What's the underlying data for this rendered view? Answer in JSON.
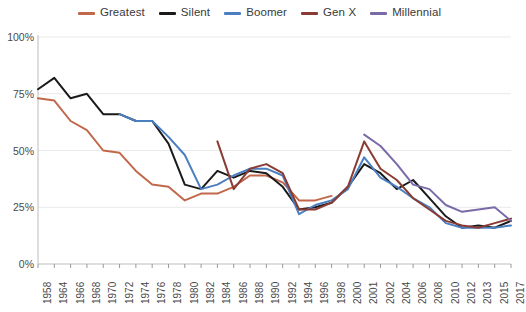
{
  "chart_data": {
    "type": "line",
    "title": "",
    "xlabel": "",
    "ylabel": "",
    "ylim": [
      0,
      100
    ],
    "ytick_labels": [
      "0%",
      "25%",
      "50%",
      "75%",
      "100%"
    ],
    "ytick_values": [
      0,
      25,
      50,
      75,
      100
    ],
    "grid": true,
    "legend_position": "top-center",
    "x": [
      1958,
      1964,
      1966,
      1968,
      1970,
      1972,
      1974,
      1976,
      1978,
      1980,
      1982,
      1984,
      1986,
      1988,
      1990,
      1992,
      1994,
      1996,
      1998,
      2000,
      2001,
      2002,
      2004,
      2006,
      2008,
      2010,
      2012,
      2013,
      2015,
      2017
    ],
    "categories": [
      "1958",
      "1964",
      "1966",
      "1968",
      "1970",
      "1972",
      "1974",
      "1976",
      "1978",
      "1980",
      "1982",
      "1984",
      "1986",
      "1988",
      "1990",
      "1992",
      "1994",
      "1996",
      "1998",
      "2000",
      "2001",
      "2002",
      "2004",
      "2006",
      "2008",
      "2010",
      "2012",
      "2013",
      "2015",
      "2017"
    ],
    "series": [
      {
        "name": "Greatest",
        "color": "#c1684a",
        "values": [
          73,
          72,
          63,
          59,
          50,
          49,
          41,
          35,
          34,
          28,
          31,
          31,
          34,
          39,
          39,
          36,
          28,
          28,
          30,
          null,
          null,
          null,
          null,
          null,
          null,
          null,
          null,
          null,
          null,
          null
        ]
      },
      {
        "name": "Silent",
        "color": "#1a1a1a",
        "values": [
          77,
          82,
          73,
          75,
          66,
          66,
          63,
          63,
          53,
          35,
          33,
          41,
          38,
          41,
          40,
          34,
          24,
          25,
          27,
          34,
          44,
          40,
          33,
          37,
          29,
          21,
          16,
          17,
          16,
          19
        ]
      },
      {
        "name": "Boomer",
        "color": "#4a7fc1",
        "values": [
          null,
          null,
          null,
          null,
          null,
          66,
          63,
          63,
          56,
          48,
          33,
          35,
          39,
          42,
          42,
          39,
          22,
          26,
          28,
          33,
          47,
          38,
          34,
          29,
          25,
          18,
          16,
          16,
          16,
          17
        ]
      },
      {
        "name": "Gen X",
        "color": "#8a3b33",
        "values": [
          null,
          null,
          null,
          null,
          null,
          null,
          null,
          null,
          null,
          null,
          null,
          54,
          33,
          42,
          44,
          40,
          24,
          24,
          27,
          34,
          54,
          42,
          37,
          29,
          24,
          19,
          17,
          16,
          18,
          20
        ]
      },
      {
        "name": "Millennial",
        "color": "#7a6ba8",
        "values": [
          null,
          null,
          null,
          null,
          null,
          null,
          null,
          null,
          null,
          null,
          null,
          null,
          null,
          null,
          null,
          null,
          null,
          null,
          null,
          null,
          57,
          52,
          44,
          35,
          33,
          26,
          23,
          24,
          25,
          19
        ]
      }
    ]
  },
  "legend": {
    "items": [
      {
        "label": "Greatest",
        "color": "#c1684a"
      },
      {
        "label": "Silent",
        "color": "#1a1a1a"
      },
      {
        "label": "Boomer",
        "color": "#4a7fc1"
      },
      {
        "label": "Gen X",
        "color": "#8a3b33"
      },
      {
        "label": "Millennial",
        "color": "#7a6ba8"
      }
    ]
  },
  "axes": {
    "grid_color": "#e9e9e9",
    "axis_color": "#bdbdbd",
    "tick_color": "#9a9a9a"
  }
}
